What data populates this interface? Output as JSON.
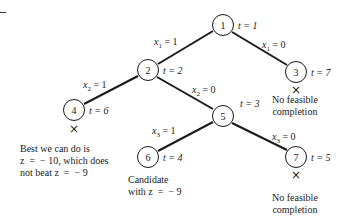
{
  "diagram": {
    "type": "branch-and-bound tree",
    "nodes": [
      {
        "id": "1",
        "t": "t = 1"
      },
      {
        "id": "2",
        "t": "t = 2"
      },
      {
        "id": "3",
        "t": "t = 7"
      },
      {
        "id": "4",
        "t": "t = 6"
      },
      {
        "id": "5",
        "t": "t = 3"
      },
      {
        "id": "6",
        "t": "t = 4"
      },
      {
        "id": "7",
        "t": "t = 5"
      }
    ],
    "edges": [
      {
        "from": "1",
        "to": "2",
        "label_var": "x",
        "label_sub": "1",
        "label_val": " = 1"
      },
      {
        "from": "1",
        "to": "3",
        "label_var": "x",
        "label_sub": "1",
        "label_val": " = 0"
      },
      {
        "from": "2",
        "to": "4",
        "label_var": "x",
        "label_sub": "2",
        "label_val": " = 1"
      },
      {
        "from": "2",
        "to": "5",
        "label_var": "x",
        "label_sub": "2",
        "label_val": " = 0"
      },
      {
        "from": "5",
        "to": "6",
        "label_var": "x",
        "label_sub": "3",
        "label_val": " = 1"
      },
      {
        "from": "5",
        "to": "7",
        "label_var": "x",
        "label_sub": "3",
        "label_val": " = 0"
      }
    ],
    "pruned_mark": "×",
    "notes": {
      "node3": "No feasible\ncompletion",
      "node4": "Best we can do is\nz  =  − 10, which does\nnot beat z  =  − 9",
      "node6": "Candidate\nwith z  =  − 9",
      "node7": "No feasible\ncompletion"
    }
  }
}
